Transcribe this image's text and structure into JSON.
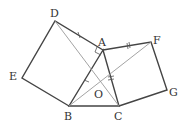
{
  "diagram": {
    "points": {
      "A": {
        "label": "A",
        "x": 103,
        "y": 50,
        "lx": 98,
        "ly": 46
      },
      "B": {
        "label": "B",
        "x": 69,
        "y": 106,
        "lx": 64,
        "ly": 120
      },
      "C": {
        "label": "C",
        "x": 119,
        "y": 106,
        "lx": 114,
        "ly": 120
      },
      "D": {
        "label": "D",
        "x": 55,
        "y": 21,
        "lx": 50,
        "ly": 17
      },
      "E": {
        "label": "E",
        "x": 22,
        "y": 78,
        "lx": 9,
        "ly": 80
      },
      "F": {
        "label": "F",
        "x": 151,
        "y": 42,
        "lx": 153,
        "ly": 44
      },
      "G": {
        "label": "G",
        "x": 167,
        "y": 90,
        "lx": 169,
        "ly": 96
      },
      "O": {
        "label": "O",
        "x": 100,
        "y": 90,
        "lx": 94,
        "ly": 98
      }
    }
  }
}
